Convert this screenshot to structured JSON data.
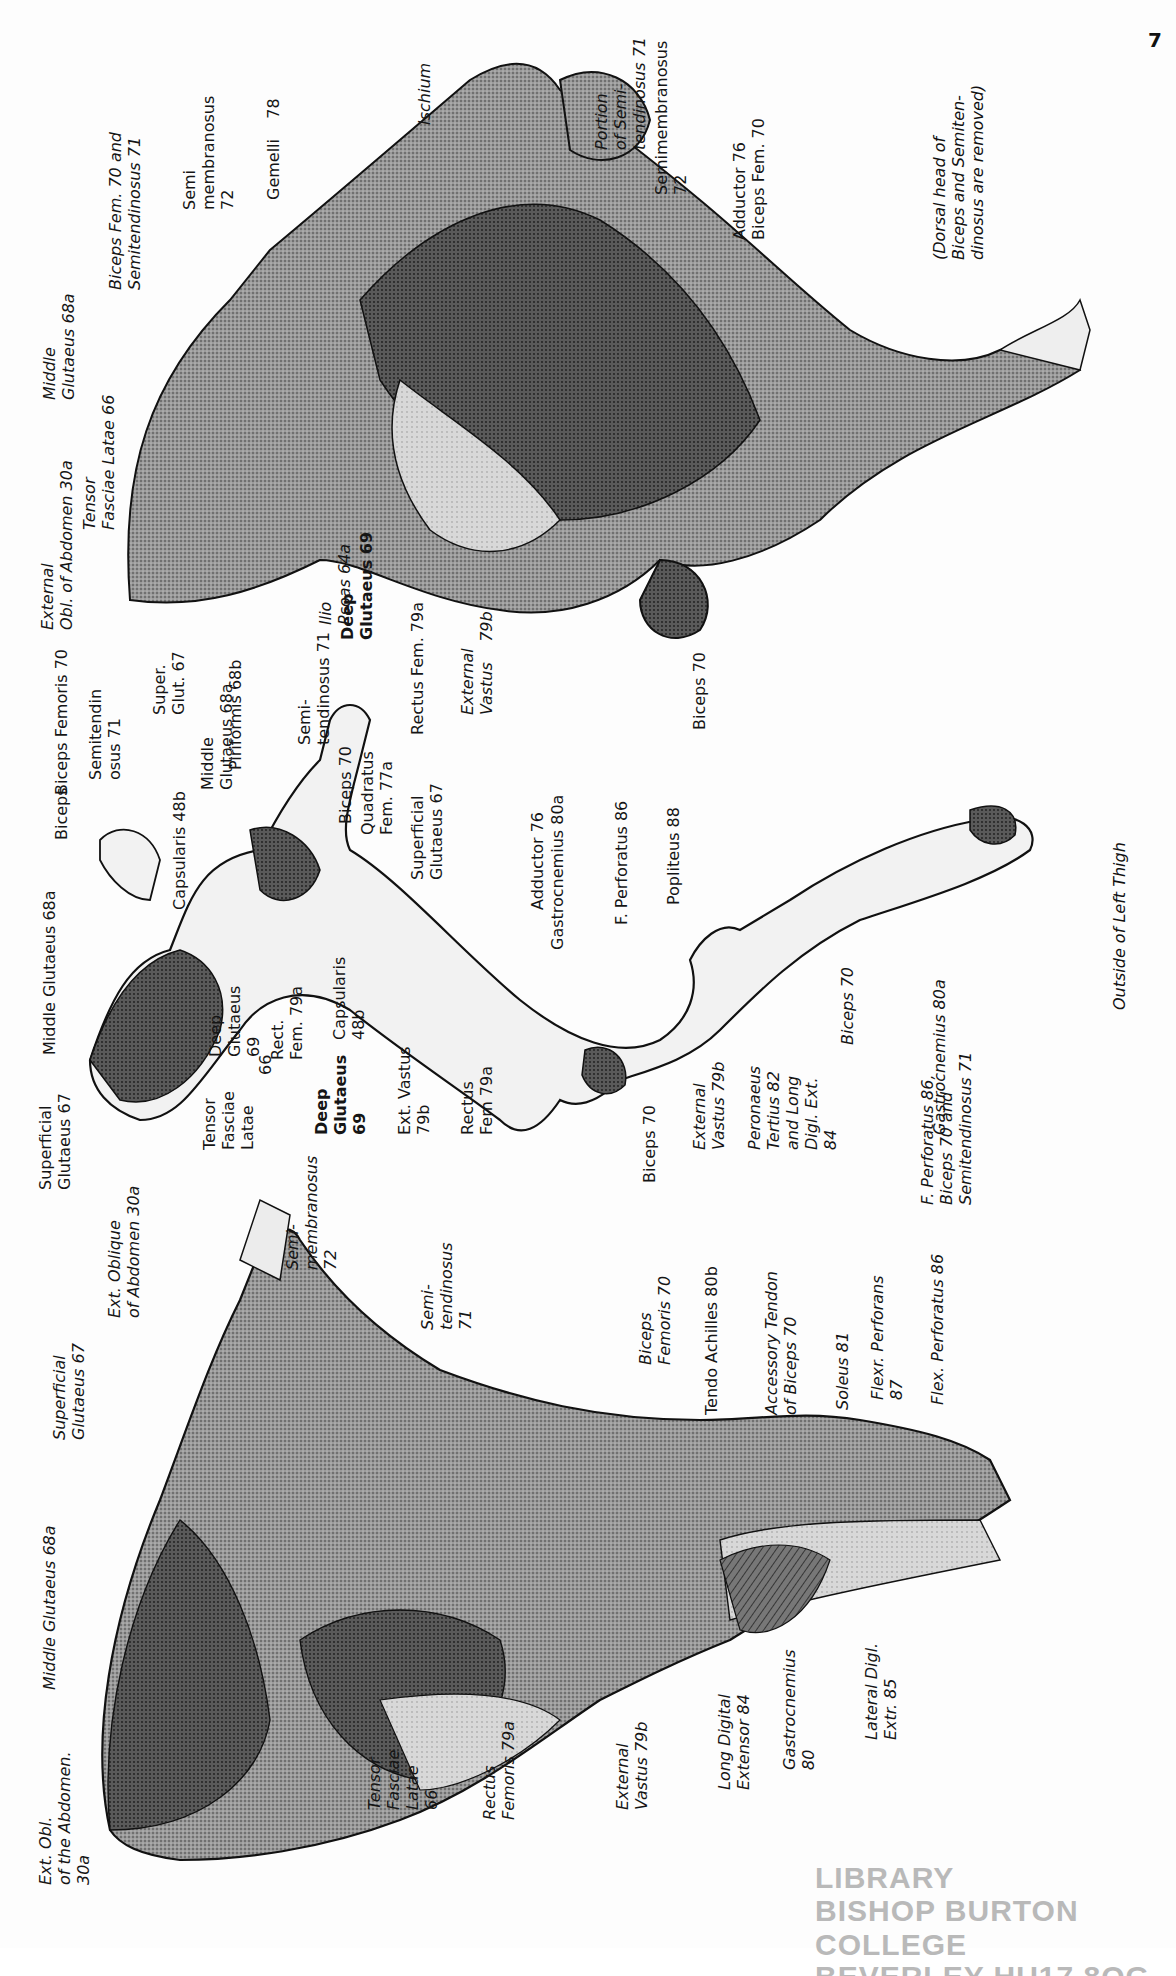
{
  "page": {
    "number": "7",
    "stamp": {
      "line1": "LIBRARY",
      "line2": "BISHOP BURTON COLLEGE",
      "line3": "BEVERLEY HU17 8QG"
    }
  },
  "figures": [
    {
      "id": "deep-dissection",
      "caption": "(Dorsal head of\nBiceps and Semiten-\ndinosus are removed)",
      "labels": [
        {
          "text": "Ischium",
          "x": 415,
          "y": 125
        },
        {
          "text": "Portion\nof Semi-\ntendinosus 71",
          "x": 592,
          "y": 150
        },
        {
          "text": "Semimembranosus\n72",
          "x": 652,
          "y": 195
        },
        {
          "text": "Adductor 76\nBiceps Fem. 70",
          "x": 730,
          "y": 240
        },
        {
          "text": "Gemelli    78",
          "x": 264,
          "y": 200
        },
        {
          "text": "Semi\nmembranosus\n72",
          "x": 180,
          "y": 210
        },
        {
          "text": "Biceps Fem. 70 and\nSemitendinosus 71",
          "x": 106,
          "y": 290
        },
        {
          "text": "Middle\nGlutaeus 68a",
          "x": 40,
          "y": 400
        },
        {
          "text": "Tensor\nFasciae Latae 66",
          "x": 80,
          "y": 530
        },
        {
          "text": "External\nObl. of Abdomen 30a",
          "x": 38,
          "y": 630
        },
        {
          "text": "Ilio\nPsoas 64a",
          "x": 316,
          "y": 625
        },
        {
          "text": "Deep\nGlutaeus 69",
          "x": 338,
          "y": 640
        },
        {
          "text": "Rectus Fem. 79a",
          "x": 408,
          "y": 735
        },
        {
          "text": "External\nVastus    79b",
          "x": 458,
          "y": 715
        },
        {
          "text": "Biceps 70",
          "x": 690,
          "y": 730
        }
      ]
    },
    {
      "id": "skeleton-attachments",
      "caption": "Outside of Left Thigh",
      "labels": [
        {
          "text": "Biceps Femoris 70",
          "x": 52,
          "y": 795
        },
        {
          "text": "Semitendin\nosus 71",
          "x": 86,
          "y": 780
        },
        {
          "text": "Super.\nGlut. 67",
          "x": 150,
          "y": 715
        },
        {
          "text": "Middle\nGlutaeus 68a",
          "x": 198,
          "y": 790
        },
        {
          "text": "Piriformis 68b",
          "x": 226,
          "y": 770
        },
        {
          "text": "Semi-\ntendinosus 71",
          "x": 295,
          "y": 745
        },
        {
          "text": "Biceps 70",
          "x": 336,
          "y": 824
        },
        {
          "text": "Quadratus\nFem. 77a",
          "x": 358,
          "y": 835
        },
        {
          "text": "Superficial\nGlutaeus 67",
          "x": 408,
          "y": 880
        },
        {
          "text": "Adductor 76",
          "x": 528,
          "y": 910
        },
        {
          "text": "Gastrocnemius 80a",
          "x": 548,
          "y": 950
        },
        {
          "text": "F. Perforatus 86",
          "x": 612,
          "y": 925
        },
        {
          "text": "Popliteus 88",
          "x": 664,
          "y": 905
        },
        {
          "text": "Middle Glutaeus 68a",
          "x": 40,
          "y": 1055
        },
        {
          "text": "Biceps",
          "x": 52,
          "y": 840
        },
        {
          "text": "Capsularis 48b",
          "x": 170,
          "y": 910
        },
        {
          "text": "Superficial\nGlutaeus 67",
          "x": 36,
          "y": 1190
        },
        {
          "text": "Tensor\nFasciae\nLatae",
          "x": 200,
          "y": 1150
        },
        {
          "text": "66",
          "x": 256,
          "y": 1075
        },
        {
          "text": "Deep\nGlutaeus\n69",
          "x": 206,
          "y": 1057
        },
        {
          "text": "Rect.\nFem. 79a",
          "x": 268,
          "y": 1060
        },
        {
          "text": "Capsularis\n48b",
          "x": 330,
          "y": 1040
        },
        {
          "text": "Deep\nGlutaeus\n69",
          "x": 312,
          "y": 1135
        },
        {
          "text": "Ext. Vastus\n79b",
          "x": 395,
          "y": 1135
        },
        {
          "text": "Rectus\nFem 79a",
          "x": 458,
          "y": 1135
        },
        {
          "text": "Biceps 70",
          "x": 640,
          "y": 1183
        },
        {
          "text": "External\nVastus 79b",
          "x": 690,
          "y": 1150
        },
        {
          "text": "Peronaeus\nTertius 82\nand Long\nDigl. Ext.\n84",
          "x": 745,
          "y": 1150
        },
        {
          "text": "Biceps 70",
          "x": 838,
          "y": 1045
        },
        {
          "text": "Gastrocnemius 80a",
          "x": 930,
          "y": 1135
        },
        {
          "text": "F. Perforatus 86,\nBiceps 70 and\nSemitendinosus 71",
          "x": 918,
          "y": 1205
        }
      ]
    },
    {
      "id": "superficial-muscles",
      "labels": [
        {
          "text": "Ext. Oblique\nof Abdomen 30a",
          "x": 105,
          "y": 1318
        },
        {
          "text": "Semi-\nmembranosus\n72",
          "x": 283,
          "y": 1270
        },
        {
          "text": "Semi-\ntendinosus\n71",
          "x": 418,
          "y": 1330
        },
        {
          "text": "Superficial\nGlutaeus 67",
          "x": 50,
          "y": 1440
        },
        {
          "text": "Biceps\nFemoris 70",
          "x": 636,
          "y": 1365
        },
        {
          "text": "Tendo Achilles 80b",
          "x": 702,
          "y": 1415
        },
        {
          "text": "Accessory Tendon\nof Biceps 70",
          "x": 762,
          "y": 1415
        },
        {
          "text": "Soleus 81",
          "x": 833,
          "y": 1410
        },
        {
          "text": "Flexr. Perforans\n87",
          "x": 868,
          "y": 1400
        },
        {
          "text": "Flex. Perforatus 86",
          "x": 928,
          "y": 1405
        },
        {
          "text": "Middle Glutaeus 68a",
          "x": 40,
          "y": 1690
        },
        {
          "text": "Ext. Obl.\nof the Abdomen.\n30a",
          "x": 36,
          "y": 1885
        },
        {
          "text": "Tensor\nFasciae\nLatae\n66",
          "x": 365,
          "y": 1810
        },
        {
          "text": "Rectus\nFemoris 79a",
          "x": 480,
          "y": 1820
        },
        {
          "text": "External\nVastus 79b",
          "x": 613,
          "y": 1810
        },
        {
          "text": "Long Digital\nExtensor 84",
          "x": 715,
          "y": 1790
        },
        {
          "text": "Gastrocnemius\n80",
          "x": 780,
          "y": 1770
        },
        {
          "text": "Lateral Digl.\nExtr. 85",
          "x": 862,
          "y": 1740
        }
      ]
    }
  ],
  "colors": {
    "ink": "#151515",
    "shading_dark": "#4a4a4a",
    "shading_mid": "#8a8a8a",
    "shading_light": "#c9c9c9",
    "stamp": "#b9b9b9",
    "paper": "#fdfdfd"
  }
}
